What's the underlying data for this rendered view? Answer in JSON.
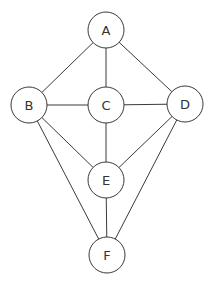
{
  "diagram": {
    "type": "graph",
    "node_radius": 18,
    "stroke_color": "#3a3a3a",
    "nodes": [
      {
        "id": "A",
        "label": "A",
        "x": 106,
        "y": 30
      },
      {
        "id": "B",
        "label": "B",
        "x": 29,
        "y": 105
      },
      {
        "id": "C",
        "label": "C",
        "x": 106,
        "y": 105
      },
      {
        "id": "D",
        "label": "D",
        "x": 185,
        "y": 104
      },
      {
        "id": "E",
        "label": "E",
        "x": 106,
        "y": 180
      },
      {
        "id": "F",
        "label": "F",
        "x": 107,
        "y": 255
      }
    ],
    "edges": [
      [
        "A",
        "B"
      ],
      [
        "A",
        "C"
      ],
      [
        "A",
        "D"
      ],
      [
        "B",
        "C"
      ],
      [
        "C",
        "D"
      ],
      [
        "C",
        "E"
      ],
      [
        "B",
        "E"
      ],
      [
        "D",
        "E"
      ],
      [
        "B",
        "F"
      ],
      [
        "D",
        "F"
      ],
      [
        "E",
        "F"
      ]
    ]
  }
}
